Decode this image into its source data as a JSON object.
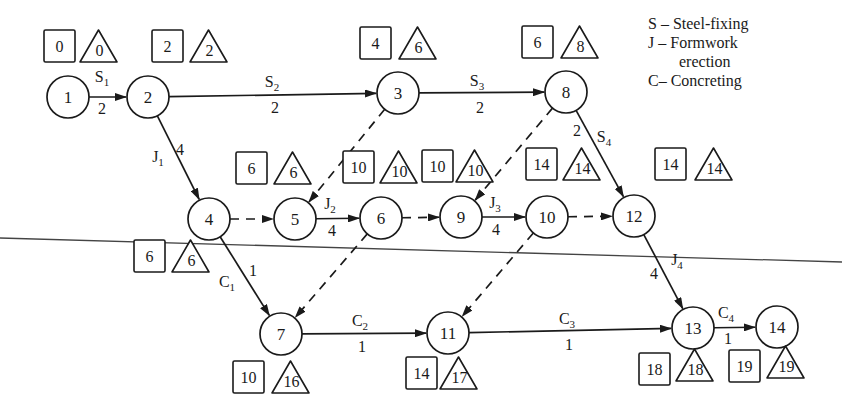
{
  "legend": {
    "items": [
      {
        "key": "S",
        "sep": " – ",
        "text": "Steel-fixing"
      },
      {
        "key": "J",
        "sep": " – ",
        "text": "Formwork"
      },
      {
        "key": "",
        "sep": "",
        "text": "erection"
      },
      {
        "key": "C",
        "sep": "– ",
        "text": "Concreting"
      }
    ]
  },
  "nodes": [
    {
      "id": "1",
      "x": 68,
      "y": 97,
      "early": "0",
      "late": "0",
      "boxX": 44,
      "boxY": 30,
      "triX": 80,
      "triY": 30
    },
    {
      "id": "2",
      "x": 148,
      "y": 97,
      "early": "2",
      "late": "2",
      "boxX": 152,
      "boxY": 30,
      "triX": 190,
      "triY": 30
    },
    {
      "id": "3",
      "x": 398,
      "y": 93,
      "early": "4",
      "late": "6",
      "boxX": 360,
      "boxY": 27,
      "triX": 399,
      "triY": 27
    },
    {
      "id": "8",
      "x": 566,
      "y": 92,
      "early": "6",
      "late": "8",
      "boxX": 522,
      "boxY": 26,
      "triX": 561,
      "triY": 26
    },
    {
      "id": "4",
      "x": 209,
      "y": 219,
      "early": "6",
      "late": "6",
      "boxX": 134,
      "boxY": 240,
      "triX": 172,
      "triY": 240
    },
    {
      "id": "5",
      "x": 295,
      "y": 219,
      "early": "6",
      "late": "6",
      "boxX": 236,
      "boxY": 152,
      "triX": 274,
      "triY": 152
    },
    {
      "id": "6",
      "x": 381,
      "y": 218,
      "early": "10",
      "late": "10",
      "boxX": 343,
      "boxY": 151,
      "triX": 380,
      "triY": 151
    },
    {
      "id": "9",
      "x": 461,
      "y": 217,
      "early": "10",
      "late": "10",
      "boxX": 422,
      "boxY": 150,
      "triX": 456,
      "triY": 150
    },
    {
      "id": "10",
      "x": 547,
      "y": 217,
      "early": "14",
      "late": "14",
      "boxX": 526,
      "boxY": 148,
      "triX": 563,
      "triY": 148
    },
    {
      "id": "12",
      "x": 634,
      "y": 216,
      "early": "14",
      "late": "14",
      "boxX": 655,
      "boxY": 148,
      "triX": 695,
      "triY": 148
    },
    {
      "id": "7",
      "x": 281,
      "y": 334,
      "early": "10",
      "late": "16",
      "boxX": 233,
      "boxY": 361,
      "triX": 272,
      "triY": 361
    },
    {
      "id": "11",
      "x": 448,
      "y": 333,
      "early": "14",
      "late": "17",
      "boxX": 406,
      "boxY": 357,
      "triX": 440,
      "triY": 357
    },
    {
      "id": "13",
      "x": 693,
      "y": 328,
      "early": "18",
      "late": "18",
      "boxX": 639,
      "boxY": 353,
      "triX": 676,
      "triY": 349
    },
    {
      "id": "14",
      "x": 777,
      "y": 327,
      "early": "19",
      "late": "19",
      "boxX": 729,
      "boxY": 350,
      "triX": 767,
      "triY": 346
    }
  ],
  "activities": [
    {
      "from": "1",
      "to": "2",
      "name": "S",
      "sub": "1",
      "duration": "2",
      "dummy": false,
      "lx": 102,
      "ly": 82,
      "dx": 102,
      "dy": 114
    },
    {
      "from": "2",
      "to": "3",
      "name": "S",
      "sub": "2",
      "duration": "2",
      "dummy": false,
      "lx": 272,
      "ly": 87,
      "dx": 275,
      "dy": 113
    },
    {
      "from": "3",
      "to": "8",
      "name": "S",
      "sub": "3",
      "duration": "2",
      "dummy": false,
      "lx": 477,
      "ly": 86,
      "dx": 480,
      "dy": 113
    },
    {
      "from": "2",
      "to": "4",
      "name": "J",
      "sub": "1",
      "duration": "4",
      "dummy": false,
      "lx": 158,
      "ly": 162,
      "dx": 180,
      "dy": 155
    },
    {
      "from": "8",
      "to": "12",
      "name": "S",
      "sub": "4",
      "duration": "2",
      "dummy": false,
      "lx": 604,
      "ly": 142,
      "dx": 577,
      "dy": 136
    },
    {
      "from": "5",
      "to": "6",
      "name": "J",
      "sub": "2",
      "duration": "4",
      "dummy": false,
      "lx": 330,
      "ly": 209,
      "dx": 332,
      "dy": 236
    },
    {
      "from": "9",
      "to": "10",
      "name": "J",
      "sub": "3",
      "duration": "4",
      "dummy": false,
      "lx": 495,
      "ly": 208,
      "dx": 496,
      "dy": 235
    },
    {
      "from": "4",
      "to": "7",
      "name": "C",
      "sub": "1",
      "duration": "1",
      "dummy": false,
      "lx": 227,
      "ly": 287,
      "dx": 253,
      "dy": 276
    },
    {
      "from": "12",
      "to": "13",
      "name": "J",
      "sub": "4",
      "duration": "4",
      "dummy": false,
      "lx": 677,
      "ly": 265,
      "dx": 654,
      "dy": 279
    },
    {
      "from": "7",
      "to": "11",
      "name": "C",
      "sub": "2",
      "duration": "1",
      "dummy": false,
      "lx": 360,
      "ly": 326,
      "dx": 362,
      "dy": 352
    },
    {
      "from": "11",
      "to": "13",
      "name": "C",
      "sub": "3",
      "duration": "1",
      "dummy": false,
      "lx": 567,
      "ly": 324,
      "dx": 569,
      "dy": 350
    },
    {
      "from": "13",
      "to": "14",
      "name": "C",
      "sub": "4",
      "duration": "1",
      "dummy": false,
      "lx": 726,
      "ly": 318,
      "dx": 728,
      "dy": 344
    },
    {
      "from": "4",
      "to": "5",
      "name": "",
      "sub": "",
      "duration": "",
      "dummy": true
    },
    {
      "from": "3",
      "to": "5",
      "name": "",
      "sub": "",
      "duration": "",
      "dummy": true
    },
    {
      "from": "6",
      "to": "9",
      "name": "",
      "sub": "",
      "duration": "",
      "dummy": true
    },
    {
      "from": "8",
      "to": "9",
      "name": "",
      "sub": "",
      "duration": "",
      "dummy": true
    },
    {
      "from": "10",
      "to": "12",
      "name": "",
      "sub": "",
      "duration": "",
      "dummy": true
    },
    {
      "from": "6",
      "to": "7",
      "name": "",
      "sub": "",
      "duration": "",
      "dummy": true
    },
    {
      "from": "10",
      "to": "11",
      "name": "",
      "sub": "",
      "duration": "",
      "dummy": true
    }
  ],
  "style": {
    "ink": "#1a1a1a",
    "scan_line": "#444444",
    "node_radius": 21
  }
}
